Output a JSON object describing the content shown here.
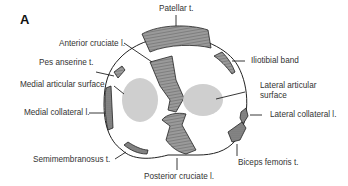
{
  "figure": {
    "panel_label": "A",
    "labels": {
      "patellar_t": "Patellar t.",
      "anterior_cruciate": "Anterior cruciate l.",
      "pes_anserine": "Pes anserine t.",
      "medial_articular": "Medial articular surface",
      "iliotibial_band": "Iliotibial band",
      "lateral_articular_1": "Lateral articular",
      "lateral_articular_2": "surface",
      "medial_collateral": "Medial collateral l.",
      "lateral_collateral": "Lateral collateral l.",
      "semimembranosus": "Semimembranosus t.",
      "posterior_cruciate": "Posterior cruciate l.",
      "biceps_femoris": "Biceps femoris t."
    },
    "colors": {
      "outline": "#222222",
      "articular_fill": "#cfcfcf",
      "tendon_fill": "#8a8a8a"
    }
  }
}
